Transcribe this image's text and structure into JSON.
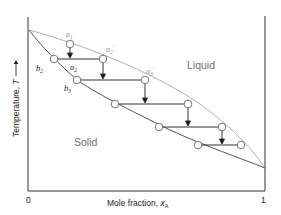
{
  "figure": {
    "x_axis": {
      "label": "Mole fraction, ",
      "symbol": "x",
      "subscript": "A",
      "tick_min": "0",
      "tick_max": "1"
    },
    "y_axis": {
      "label": "Temperature, ",
      "symbol": "T",
      "arrow": "→"
    },
    "regions": {
      "liquid": "Liquid",
      "solid": "Solid"
    },
    "points": {
      "a1": {
        "base": "a",
        "sub": "1",
        "prime": ""
      },
      "a2": {
        "base": "a",
        "sub": "2",
        "prime": ""
      },
      "a2p": {
        "base": "a",
        "sub": "2",
        "prime": "′"
      },
      "a3p": {
        "base": "a",
        "sub": "3",
        "prime": "′"
      },
      "b2": {
        "base": "b",
        "sub": "2",
        "prime": ""
      },
      "b3": {
        "base": "b",
        "sub": "3",
        "prime": ""
      }
    },
    "colors": {
      "axis": "#333333",
      "liquidus": "#a8a8a8",
      "solidus": "#555555",
      "tie_line": "#333333",
      "circle_stroke": "#666666"
    }
  }
}
